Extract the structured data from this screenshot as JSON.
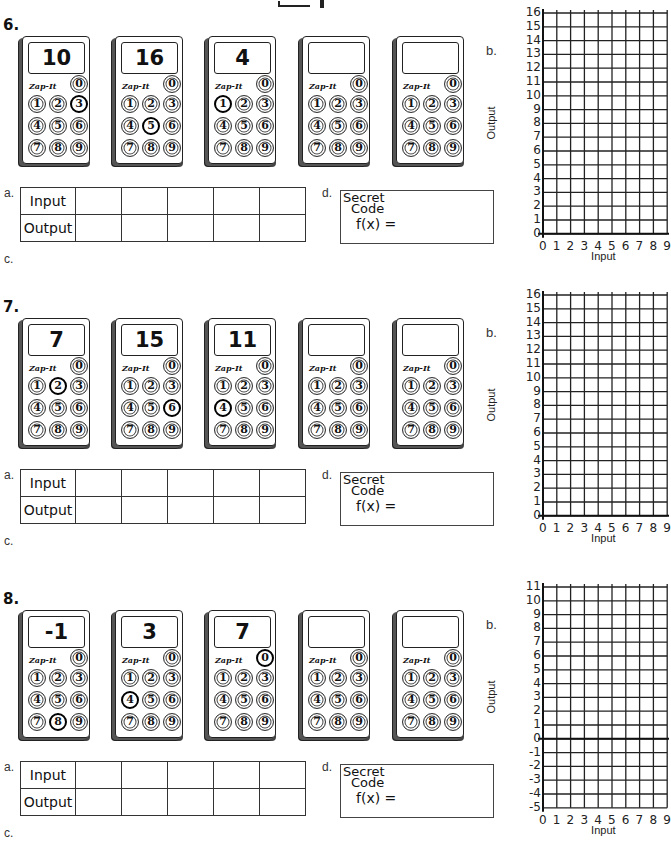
{
  "header_fragment": "",
  "labels": {
    "a": "a.",
    "b": "b.",
    "c": "c.",
    "d": "d.",
    "input": "Input",
    "output": "Output",
    "secret1": "Secret",
    "secret2": "Code",
    "secret3": "f(x) =",
    "brand": "Zap-It",
    "x_axis": "Input",
    "y_axis": "Output"
  },
  "problems": [
    {
      "number": "6.",
      "calculators": [
        {
          "display": "10",
          "pressed": "3"
        },
        {
          "display": "16",
          "pressed": "5"
        },
        {
          "display": "4",
          "pressed": "1"
        },
        {
          "display": "",
          "pressed": ""
        },
        {
          "display": "",
          "pressed": ""
        }
      ],
      "table": {
        "input": [
          "",
          "",
          "",
          "",
          ""
        ],
        "output": [
          "",
          "",
          "",
          "",
          ""
        ]
      },
      "graph": {
        "y_min": 0,
        "y_max": 16,
        "x_min": 0,
        "x_max": 9,
        "y_ticks": [
          "16",
          "15",
          "14",
          "13",
          "12",
          "11",
          "10",
          "9",
          "8",
          "7",
          "6",
          "5",
          "4",
          "3",
          "2",
          "1",
          "0"
        ],
        "x_ticks": [
          "0",
          "1",
          "2",
          "3",
          "4",
          "5",
          "6",
          "7",
          "8",
          "9"
        ]
      }
    },
    {
      "number": "7.",
      "calculators": [
        {
          "display": "7",
          "pressed": "2"
        },
        {
          "display": "15",
          "pressed": "6"
        },
        {
          "display": "11",
          "pressed": "4"
        },
        {
          "display": "",
          "pressed": ""
        },
        {
          "display": "",
          "pressed": ""
        }
      ],
      "table": {
        "input": [
          "",
          "",
          "",
          "",
          ""
        ],
        "output": [
          "",
          "",
          "",
          "",
          ""
        ]
      },
      "graph": {
        "y_min": 0,
        "y_max": 16,
        "x_min": 0,
        "x_max": 9,
        "y_ticks": [
          "16",
          "15",
          "14",
          "13",
          "12",
          "11",
          "10",
          "9",
          "8",
          "7",
          "6",
          "5",
          "4",
          "3",
          "2",
          "1",
          "0"
        ],
        "x_ticks": [
          "0",
          "1",
          "2",
          "3",
          "4",
          "5",
          "6",
          "7",
          "8",
          "9"
        ]
      }
    },
    {
      "number": "8.",
      "calculators": [
        {
          "display": "-1",
          "pressed": "8"
        },
        {
          "display": "3",
          "pressed": "4"
        },
        {
          "display": "7",
          "pressed": "0"
        },
        {
          "display": "",
          "pressed": ""
        },
        {
          "display": "",
          "pressed": ""
        }
      ],
      "table": {
        "input": [
          "",
          "",
          "",
          "",
          ""
        ],
        "output": [
          "",
          "",
          "",
          "",
          ""
        ]
      },
      "graph": {
        "y_min": -5,
        "y_max": 11,
        "x_min": 0,
        "x_max": 9,
        "y_ticks": [
          "11",
          "10",
          "9",
          "8",
          "7",
          "6",
          "5",
          "4",
          "3",
          "2",
          "1",
          "0",
          "-1",
          "-2",
          "-3",
          "-4",
          "-5"
        ],
        "x_ticks": [
          "0",
          "1",
          "2",
          "3",
          "4",
          "5",
          "6",
          "7",
          "8",
          "9"
        ]
      }
    }
  ]
}
